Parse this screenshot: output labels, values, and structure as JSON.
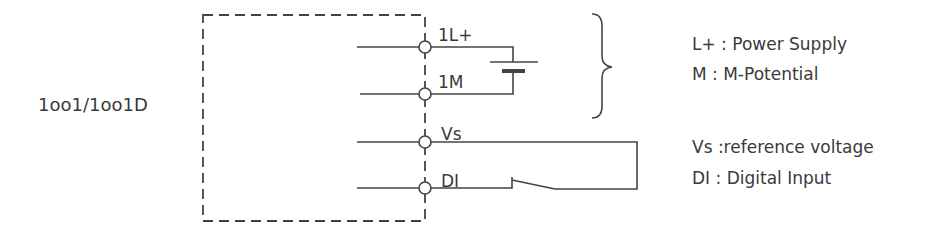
{
  "module_label": "1oo1/1oo1D",
  "terminals": [
    {
      "name": "1L+",
      "y": 47
    },
    {
      "name": "1M",
      "y": 94
    },
    {
      "name": "Vs",
      "y": 142
    },
    {
      "name": "DI",
      "y": 188
    }
  ],
  "legend": [
    {
      "text": "L+ : Power Supply"
    },
    {
      "text": "M : M-Potential"
    },
    {
      "text": "Vs :reference voltage"
    },
    {
      "text": "DI : Digital Input"
    }
  ],
  "colors": {
    "line": "#444444",
    "text": "#3a3a3a"
  }
}
